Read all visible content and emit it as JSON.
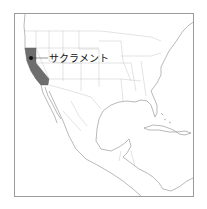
{
  "map": {
    "region": "North America",
    "highlighted_state": "California",
    "highlight_color": "#6e6e6e",
    "land_fill": "#ffffff",
    "border_color": "#b4b4b4",
    "coast_color": "#8a8a8a",
    "marker": {
      "label": "サクラメント",
      "marker_color": "#111111"
    }
  }
}
